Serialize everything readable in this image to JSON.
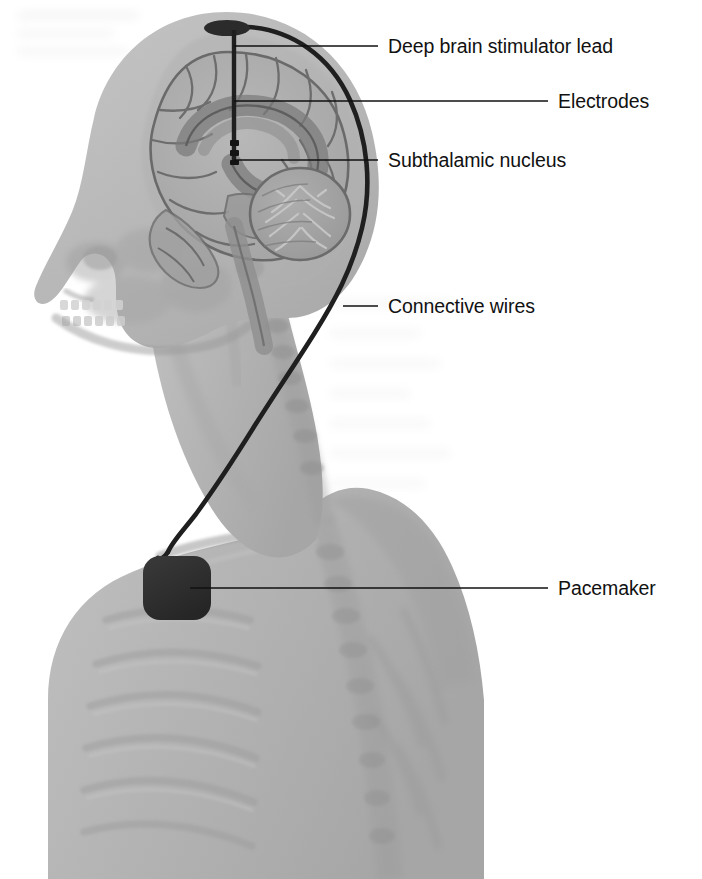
{
  "figure": {
    "view": "left lateral sagittal section of head, neck and upper thorax",
    "background_color": "#ffffff",
    "body_tone": "#b3b3b3",
    "ink_color": "#111111",
    "device_color": "#2f2f2f"
  },
  "labels": [
    {
      "id": "deep-brain-stimulator-lead",
      "text": "Deep brain stimulator lead",
      "text_x": 388,
      "text_y": 53,
      "leader": {
        "x1": 234,
        "y1": 46,
        "x2": 378,
        "y2": 46
      }
    },
    {
      "id": "electrodes",
      "text": "Electrodes",
      "text_x": 558,
      "text_y": 108,
      "leader": {
        "x1": 234,
        "y1": 101,
        "x2": 548,
        "y2": 101
      }
    },
    {
      "id": "subthalamic-nucleus",
      "text": "Subthalamic nucleus",
      "text_x": 388,
      "text_y": 167,
      "leader": {
        "x1": 234,
        "y1": 160,
        "x2": 378,
        "y2": 160
      }
    },
    {
      "id": "connective-wires",
      "text": "Connective wires",
      "text_x": 388,
      "text_y": 313,
      "leader": {
        "x1": 343,
        "y1": 306,
        "x2": 378,
        "y2": 306
      }
    },
    {
      "id": "pacemaker",
      "text": "Pacemaker",
      "text_x": 558,
      "text_y": 595,
      "leader": {
        "x1": 190,
        "y1": 588,
        "x2": 548,
        "y2": 588
      }
    }
  ],
  "anatomy": {
    "parts": [
      "head-silhouette",
      "skull",
      "facial-bones",
      "teeth",
      "mandible",
      "cerebrum",
      "corpus-callosum",
      "cerebellum",
      "brainstem",
      "cervical-spine",
      "clavicle",
      "ribcage",
      "thoracic-spine",
      "shoulder"
    ]
  },
  "devices": {
    "burr_hole_cap": {
      "cx": 227,
      "cy": 28,
      "rx": 23,
      "ry": 8
    },
    "lead": {
      "x": 234,
      "y_top": 30,
      "y_bottom": 163
    },
    "pacemaker": {
      "x": 143,
      "y": 556,
      "width": 68,
      "height": 64
    }
  }
}
